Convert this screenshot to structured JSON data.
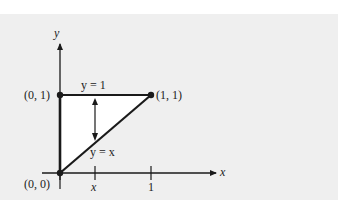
{
  "diagram": {
    "background_color": "#efefef",
    "line_color": "#1a1a1a",
    "region_fill": "#ffffff",
    "axes": {
      "x_label": "x",
      "y_label": "y"
    },
    "points": [
      {
        "label": "(0, 0)"
      },
      {
        "label": "(0, 1)"
      },
      {
        "label": "(1, 1)"
      }
    ],
    "curves": {
      "top": "y = 1",
      "diagonal": "y = x"
    },
    "ticks": {
      "x_var": "x",
      "one": "1"
    }
  }
}
